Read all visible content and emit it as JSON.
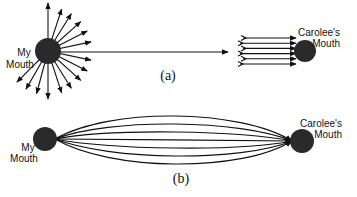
{
  "panel_a": {
    "caption": "(a)",
    "source_label_line1": "My",
    "source_label_line2": "Mouth",
    "target_label_line1": "Carolee's",
    "target_label_line2": "Mouth",
    "radiating_arrow_count": 15,
    "converging_arrow_count": 6
  },
  "panel_b": {
    "caption": "(b)",
    "source_label_line1": "My",
    "source_label_line2": "Mouth",
    "target_label_line1": "Carolee's",
    "target_label_line2": "Mouth",
    "beam_line_count": 7
  },
  "colors": {
    "ink": "#111111",
    "ball": "#2a2a2a"
  }
}
